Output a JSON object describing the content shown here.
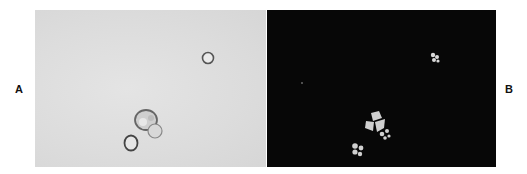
{
  "figure": {
    "panels": [
      {
        "label": "A",
        "description": "Bright-field micrograph of cells",
        "background": "#dcdcdc"
      },
      {
        "label": "B",
        "description": "Fluorescence micrograph of same field",
        "background": "#070707"
      }
    ]
  }
}
